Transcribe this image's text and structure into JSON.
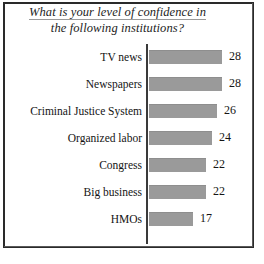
{
  "figure": {
    "title_line_1": "What is your level of confidence in",
    "title_line_2": "the following institutions?"
  },
  "colors": {
    "bar_fill": "#9a9a9a",
    "axis": "#3a3a3a",
    "frame": "#2a2a2a",
    "text": "#141414",
    "background": "#ffffff"
  },
  "chart_data": {
    "type": "bar",
    "orientation": "horizontal",
    "title": "What is your level of confidence in the following institutions?",
    "xlabel": "",
    "ylabel": "",
    "grid": false,
    "legend": null,
    "xlim": [
      0,
      28
    ],
    "value_labels": true,
    "categories": [
      "TV news",
      "Newspapers",
      "Criminal Justice System",
      "Organized labor",
      "Congress",
      "Big business",
      "HMOs"
    ],
    "values": [
      28,
      28,
      26,
      24,
      22,
      22,
      17
    ],
    "bars": [
      {
        "label": "TV news",
        "value": 28,
        "value_text": "28"
      },
      {
        "label": "Newspapers",
        "value": 28,
        "value_text": "28"
      },
      {
        "label": "Criminal Justice System",
        "value": 26,
        "value_text": "26"
      },
      {
        "label": "Organized labor",
        "value": 24,
        "value_text": "24"
      },
      {
        "label": "Congress",
        "value": 22,
        "value_text": "22"
      },
      {
        "label": "Big business",
        "value": 22,
        "value_text": "22"
      },
      {
        "label": "HMOs",
        "value": 17,
        "value_text": "17"
      }
    ]
  }
}
